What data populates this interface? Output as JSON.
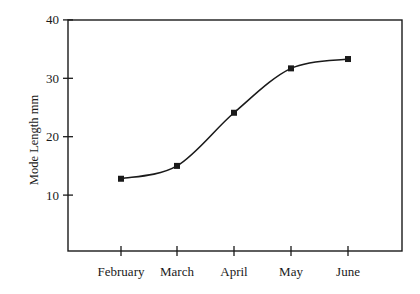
{
  "chart_data": {
    "type": "line",
    "title": "",
    "xlabel": "",
    "ylabel": "Mode Length mm",
    "categories": [
      "February",
      "March",
      "April",
      "May",
      "June"
    ],
    "series": [
      {
        "name": "Mode Length",
        "values": [
          12.8,
          15.0,
          24.1,
          31.7,
          33.3
        ],
        "marker": "square",
        "smooth": true,
        "color": "#1a1a1a"
      }
    ],
    "ylim": [
      0,
      40
    ],
    "yticks": [
      10,
      20,
      30,
      40
    ],
    "ytick_labels": [
      "10",
      "20",
      "30",
      "40"
    ],
    "grid": false,
    "legend": false,
    "frame": "box"
  }
}
